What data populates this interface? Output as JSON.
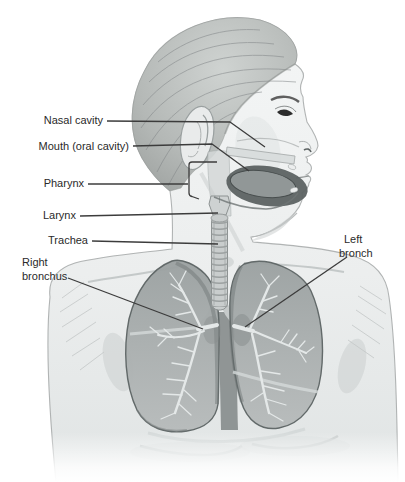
{
  "figure": {
    "labels": {
      "nasal_cavity": "Nasal cavity",
      "mouth": "Mouth (oral cavity)",
      "pharynx": "Pharynx",
      "larynx": "Larynx",
      "trachea": "Trachea",
      "right_bronchus": {
        "line1": "Right",
        "line2": "bronchus"
      },
      "left_bronchus": {
        "line1": "Left",
        "line2": "bronch"
      }
    },
    "colors": {
      "background": "#ffffff",
      "label_text": "#2a2a2a",
      "pointer_line": "#3c3c3c",
      "skin_light": "#f2f4f4",
      "skin_shade": "#dde1e1",
      "hair": "#aeb2b0",
      "lung_fill": "#a9aeae",
      "lung_outline": "#5d6464",
      "bronchial_branches": "#e4e8e8",
      "oral_cavity_dark": "#5c6262",
      "trachea_fill": "#c9cdcd"
    }
  }
}
